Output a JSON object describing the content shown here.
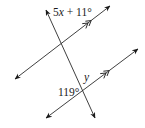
{
  "diagram": {
    "type": "parallel-lines-transversal",
    "labels": {
      "top_angle": "5x + 11°",
      "top_angle_parts": {
        "coef": "5",
        "var": "x",
        "rest": " + 11°"
      },
      "y_angle": "y",
      "bottom_angle": "119°"
    },
    "lines": [
      {
        "name": "transversal",
        "from": [
          46,
          10
        ],
        "to": [
          95,
          118
        ]
      },
      {
        "name": "upper-parallel",
        "from": [
          15,
          79
        ],
        "to": [
          110,
          6
        ],
        "parallel_marks": 2
      },
      {
        "name": "lower-parallel",
        "from": [
          46,
          118
        ],
        "to": [
          138,
          49
        ],
        "parallel_marks": 2
      }
    ],
    "colors": {
      "ink": "#1a1a1a",
      "background": "#ffffff"
    }
  }
}
